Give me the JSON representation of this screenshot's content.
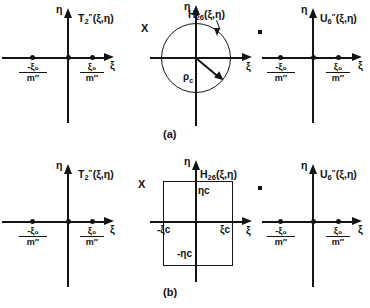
{
  "figure": {
    "rows": [
      {
        "id": "row-a",
        "caption": "(a)",
        "operators": {
          "multiply": "X",
          "equals": "="
        },
        "panels": [
          {
            "id": "panel-a-left",
            "kind": "axes-with-points",
            "function_label": {
              "base": "T",
              "sub": "2",
              "sup": "″",
              "args": "(ξ,η)"
            },
            "axis_x_label": "ξ",
            "axis_y_label": "η",
            "point_labels": [
              {
                "num": "-ξ₀",
                "den": "m″"
              },
              {
                "num": "ξ₀",
                "den": "m″"
              }
            ]
          },
          {
            "id": "panel-a-middle",
            "kind": "axes-with-circle",
            "function_label": {
              "base": "H",
              "sub": "26",
              "sup": "",
              "args": "(ξ,η)"
            },
            "axis_x_label": "ξ",
            "axis_y_label": "η",
            "radius_label": {
              "base": "ρ",
              "sub": "c"
            }
          },
          {
            "id": "panel-a-right",
            "kind": "axes-with-points",
            "function_label": {
              "base": "U",
              "sub": "6",
              "sup": "″",
              "args": "(ξ,η)"
            },
            "axis_x_label": "ξ",
            "axis_y_label": "η",
            "point_labels": [
              {
                "num": "-ξ₀",
                "den": "m″"
              },
              {
                "num": "ξ₀",
                "den": "m″"
              }
            ]
          }
        ]
      },
      {
        "id": "row-b",
        "caption": "(b)",
        "operators": {
          "multiply": "X",
          "equals": "="
        },
        "panels": [
          {
            "id": "panel-b-left",
            "kind": "axes-with-points",
            "function_label": {
              "base": "T",
              "sub": "2",
              "sup": "″",
              "args": "(ξ,η)"
            },
            "axis_x_label": "ξ",
            "axis_y_label": "η",
            "point_labels": [
              {
                "num": "-ξ₀",
                "den": "m″"
              },
              {
                "num": "ξ₀",
                "den": "m″"
              }
            ]
          },
          {
            "id": "panel-b-middle",
            "kind": "axes-with-rectangle",
            "function_label": {
              "base": "H",
              "sub": "26",
              "sup": "",
              "args": "(ξ,η)"
            },
            "axis_x_label": "ξ",
            "axis_y_label": "η",
            "rect_labels": {
              "top": "ηc",
              "bottom": "-ηc",
              "left": "-ξc",
              "right": "ξc"
            }
          },
          {
            "id": "panel-b-right",
            "kind": "axes-with-points",
            "function_label": {
              "base": "U",
              "sub": "6",
              "sup": "″",
              "args": "(ξ,η)"
            },
            "axis_x_label": "ξ",
            "axis_y_label": "η",
            "point_labels": [
              {
                "num": "-ξ₀",
                "den": "m″"
              },
              {
                "num": "ξ₀",
                "den": "m″"
              }
            ]
          }
        ]
      }
    ]
  },
  "colors": {
    "ink": "#151515",
    "background": "#ffffff"
  }
}
